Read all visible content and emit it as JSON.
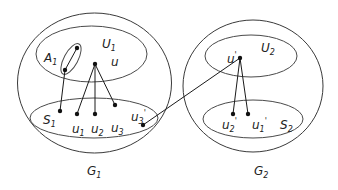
{
  "diagram": {
    "type": "set-graph",
    "graphs": [
      {
        "id": "G1",
        "label": "G",
        "label_sub": "1",
        "sets": [
          {
            "id": "U1",
            "label": "U",
            "label_sub": "1"
          },
          {
            "id": "A1",
            "label": "A",
            "label_sub": "1"
          },
          {
            "id": "S1",
            "label": "S",
            "label_sub": "1"
          }
        ],
        "vertices": [
          {
            "id": "u",
            "label": "u",
            "label_sub": ""
          },
          {
            "id": "u1",
            "label": "u",
            "label_sub": "1"
          },
          {
            "id": "u2",
            "label": "u",
            "label_sub": "2"
          },
          {
            "id": "u3",
            "label": "u",
            "label_sub": "3"
          },
          {
            "id": "u3p",
            "label": "u",
            "label_sub": "3",
            "prime": "'"
          }
        ]
      },
      {
        "id": "G2",
        "label": "G",
        "label_sub": "2",
        "sets": [
          {
            "id": "U2",
            "label": "U",
            "label_sub": "2"
          },
          {
            "id": "S2",
            "label": "S",
            "label_sub": "2"
          }
        ],
        "vertices": [
          {
            "id": "up",
            "label": "u",
            "label_sub": "",
            "prime": "'"
          },
          {
            "id": "u2p",
            "label": "u",
            "label_sub": "2",
            "prime": "'"
          },
          {
            "id": "u1p",
            "label": "u",
            "label_sub": "1",
            "prime": "'"
          }
        ]
      }
    ],
    "edges": [
      [
        "A1_top",
        "A1_bottom"
      ],
      [
        "A1_bottom",
        "S1_dot"
      ],
      [
        "u",
        "u1"
      ],
      [
        "u",
        "u2"
      ],
      [
        "u",
        "u3"
      ],
      [
        "up",
        "u3p"
      ],
      [
        "up",
        "u2p"
      ],
      [
        "up",
        "u1p"
      ]
    ],
    "colors": {
      "stroke": "#3a3a3a",
      "vertex": "#111111",
      "background": "#ffffff"
    }
  }
}
